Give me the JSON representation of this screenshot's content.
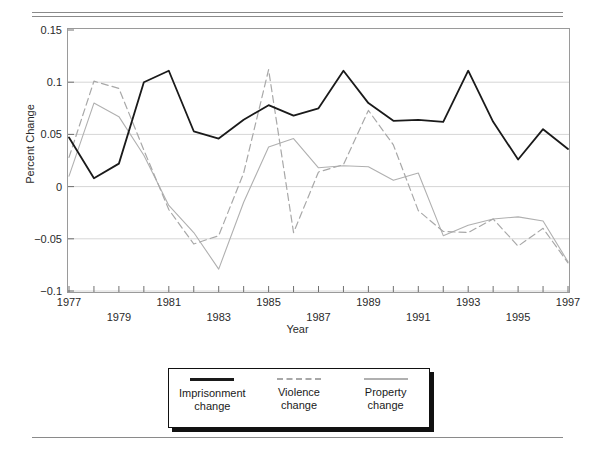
{
  "chart_data": {
    "type": "line",
    "title": "",
    "xlabel": "Year",
    "ylabel": "Percent Change",
    "xlim": [
      1977,
      1997
    ],
    "ylim": [
      -0.1,
      0.15
    ],
    "yticks": [
      0.15,
      0.1,
      0.05,
      0,
      -0.05,
      -0.1
    ],
    "ytick_labels": [
      "0.15",
      "0.1",
      "0.05",
      "0",
      "−0.05",
      "−0.1"
    ],
    "grid": "horizontal",
    "legend_position": "below-plot",
    "x": [
      1977,
      1978,
      1979,
      1980,
      1981,
      1982,
      1983,
      1984,
      1985,
      1986,
      1987,
      1988,
      1989,
      1990,
      1991,
      1992,
      1993,
      1994,
      1995,
      1996,
      1997
    ],
    "xtick_labels_upper": [
      "1977",
      "1981",
      "1985",
      "1989",
      "1993",
      "1997"
    ],
    "xtick_labels_lower": [
      "1979",
      "1983",
      "1987",
      "1991",
      "1995"
    ],
    "series": [
      {
        "name": "Imprisonment change",
        "style": "solid",
        "color": "#1a1a1a",
        "width": 1.8,
        "values": [
          0.047,
          0.008,
          0.022,
          0.1,
          0.111,
          0.053,
          0.046,
          0.064,
          0.078,
          0.068,
          0.075,
          0.111,
          0.08,
          0.063,
          0.064,
          0.062,
          0.111,
          0.062,
          0.026,
          0.055,
          0.036
        ]
      },
      {
        "name": "Violence change",
        "style": "dashed",
        "color": "#a8a8a8",
        "width": 1.2,
        "values": [
          0.028,
          0.101,
          0.094,
          0.035,
          -0.022,
          -0.055,
          -0.047,
          0.013,
          0.112,
          -0.044,
          0.014,
          0.021,
          0.073,
          0.04,
          -0.023,
          -0.043,
          -0.044,
          -0.031,
          -0.057,
          -0.04,
          -0.073
        ]
      },
      {
        "name": "Property change",
        "style": "solid",
        "color": "#b0b0b0",
        "width": 1.1,
        "values": [
          0.01,
          0.08,
          0.067,
          0.03,
          -0.018,
          -0.044,
          -0.079,
          -0.015,
          0.038,
          0.046,
          0.018,
          0.02,
          0.019,
          0.006,
          0.013,
          -0.047,
          -0.037,
          -0.031,
          -0.029,
          -0.033,
          -0.072
        ]
      }
    ]
  },
  "legend": {
    "items": [
      {
        "line1": "Imprisonment",
        "line2": "change"
      },
      {
        "line1": "Violence",
        "line2": "change"
      },
      {
        "line1": "Property",
        "line2": "change"
      }
    ]
  }
}
